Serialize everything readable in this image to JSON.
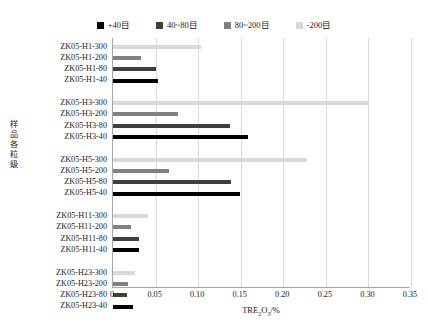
{
  "chart_data": {
    "type": "bar",
    "orientation": "horizontal",
    "title": "",
    "xlabel": "TRE2O3/%",
    "xlabel_html": "TRE<sub>2</sub>O<sub>3</sub>/%",
    "ylabel": "样品各粒级",
    "xlim": [
      0,
      0.35
    ],
    "xticks": [
      "0",
      "0.05",
      "0.10",
      "0.15",
      "0.20",
      "0.25",
      "0.30",
      "0.35"
    ],
    "xtick_values": [
      0,
      0.05,
      0.1,
      0.15,
      0.2,
      0.25,
      0.3,
      0.35
    ],
    "grid": "vertical",
    "legend_position": "top",
    "legend": [
      {
        "label": "+40目",
        "color": "#000000"
      },
      {
        "label": "40~80目",
        "color": "#3f3f3f"
      },
      {
        "label": "80~200目",
        "color": "#808080"
      },
      {
        "label": "-200目",
        "color": "#d9d9d9"
      }
    ],
    "series": [
      {
        "name": "+40目",
        "color": "#000000"
      },
      {
        "name": "40~80目",
        "color": "#3f3f3f"
      },
      {
        "name": "80~200目",
        "color": "#808080"
      },
      {
        "name": "-200目",
        "color": "#d9d9d9"
      }
    ],
    "groups": [
      {
        "name": "ZK05-H1",
        "categories": [
          "ZK05-H1-300",
          "ZK05-H1-200",
          "ZK05-H1-80",
          "ZK05-H1-40"
        ],
        "bars": [
          {
            "label": "ZK05-H1-300",
            "series": "-200目",
            "value": 0.103,
            "color": "#d9d9d9"
          },
          {
            "label": "ZK05-H1-200",
            "series": "80~200目",
            "value": 0.033,
            "color": "#808080"
          },
          {
            "label": "ZK05-H1-80",
            "series": "40~80目",
            "value": 0.051,
            "color": "#3f3f3f"
          },
          {
            "label": "ZK05-H1-40",
            "series": "+40目",
            "value": 0.053,
            "color": "#000000"
          }
        ]
      },
      {
        "name": "ZK05-H3",
        "categories": [
          "ZK05-H3-300",
          "ZK05-H3-200",
          "ZK05-H3-80",
          "ZK05-H3-40"
        ],
        "bars": [
          {
            "label": "ZK05-H3-300",
            "series": "-200目",
            "value": 0.3,
            "color": "#d9d9d9"
          },
          {
            "label": "ZK05-H3-200",
            "series": "80~200目",
            "value": 0.076,
            "color": "#808080"
          },
          {
            "label": "ZK05-H3-80",
            "series": "40~80目",
            "value": 0.138,
            "color": "#3f3f3f"
          },
          {
            "label": "ZK05-H3-40",
            "series": "+40目",
            "value": 0.159,
            "color": "#000000"
          }
        ]
      },
      {
        "name": "ZK05-H5",
        "categories": [
          "ZK05-H5-300",
          "ZK05-H5-200",
          "ZK05-H5-80",
          "ZK05-H5-40"
        ],
        "bars": [
          {
            "label": "ZK05-H5-300",
            "series": "-200目",
            "value": 0.228,
            "color": "#d9d9d9"
          },
          {
            "label": "ZK05-H5-200",
            "series": "80~200目",
            "value": 0.066,
            "color": "#808080"
          },
          {
            "label": "ZK05-H5-80",
            "series": "40~80目",
            "value": 0.139,
            "color": "#3f3f3f"
          },
          {
            "label": "ZK05-H5-40",
            "series": "+40目",
            "value": 0.149,
            "color": "#000000"
          }
        ]
      },
      {
        "name": "ZK05-H11",
        "categories": [
          "ZK05-H11-300",
          "ZK05-H11-200",
          "ZK05-H11-80",
          "ZK05-H11-40"
        ],
        "bars": [
          {
            "label": "ZK05-H11-300",
            "series": "-200目",
            "value": 0.041,
            "color": "#d9d9d9"
          },
          {
            "label": "ZK05-H11-200",
            "series": "80~200目",
            "value": 0.021,
            "color": "#808080"
          },
          {
            "label": "ZK05-H11-80",
            "series": "40~80目",
            "value": 0.03,
            "color": "#3f3f3f"
          },
          {
            "label": "ZK05-H11-40",
            "series": "+40目",
            "value": 0.03,
            "color": "#000000"
          }
        ]
      },
      {
        "name": "ZK05-H23",
        "categories": [
          "ZK05-H23-300",
          "ZK05-H23-200",
          "ZK05-H23-80",
          "ZK05-H23-40"
        ],
        "bars": [
          {
            "label": "ZK05-H23-300",
            "series": "-200目",
            "value": 0.026,
            "color": "#d9d9d9"
          },
          {
            "label": "ZK05-H23-200",
            "series": "80~200目",
            "value": 0.018,
            "color": "#808080"
          },
          {
            "label": "ZK05-H23-80",
            "series": "40~80目",
            "value": 0.017,
            "color": "#3f3f3f"
          },
          {
            "label": "ZK05-H23-40",
            "series": "+40目",
            "value": 0.023,
            "color": "#000000"
          }
        ]
      }
    ]
  }
}
